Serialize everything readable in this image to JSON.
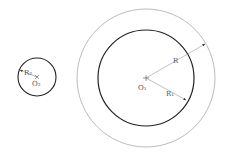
{
  "diagram": {
    "small_circle": {
      "center_label": "O₂",
      "radius_label": "R₂",
      "cx": 37,
      "cy": 77,
      "r": 19
    },
    "large_inner_circle": {
      "center_label": "O₁",
      "radius_label": "R₁",
      "cx": 146,
      "cy": 78,
      "r": 48
    },
    "large_outer_circle": {
      "radius_label": "R",
      "cx": 146,
      "cy": 78,
      "r": 69
    },
    "colors": {
      "dark_stroke": "#222222",
      "light_stroke": "#999999",
      "text": "#555555"
    }
  }
}
